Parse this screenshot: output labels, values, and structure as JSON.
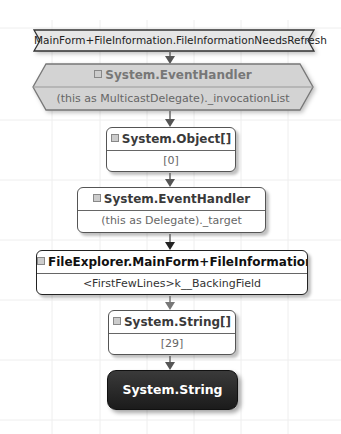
{
  "diagram": {
    "root": {
      "label": "MainForm+FileInformation.FileInformationNeedsRefresh",
      "shape": "ribbon"
    },
    "nodes": [
      {
        "type": "System.EventHandler",
        "path": "(this as MulticastDelegate)._invocationList",
        "shape": "hexagon",
        "style": "gray"
      },
      {
        "type": "System.Object[]",
        "path": "[0]",
        "shape": "rounded-box"
      },
      {
        "type": "System.EventHandler",
        "path": "(this as Delegate)._target",
        "shape": "rounded-box"
      },
      {
        "type": "FileExplorer.MainForm+FileInformation",
        "path": "<FirstFewLines>k__BackingField",
        "shape": "rounded-box",
        "style": "bold"
      },
      {
        "type": "System.String[]",
        "path": "[29]",
        "shape": "rounded-box"
      },
      {
        "type": "System.String",
        "shape": "rounded-box",
        "style": "dark"
      }
    ],
    "colors": {
      "dark_node": "#222222",
      "hexagon_fill": "#d0d0d0",
      "border": "#555555",
      "arrow": "#666666"
    }
  }
}
